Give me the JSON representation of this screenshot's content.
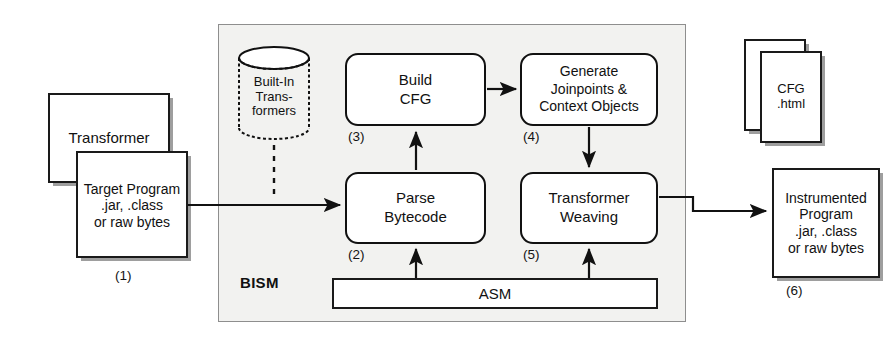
{
  "figure": {
    "container_label": "BISM"
  },
  "nodes": {
    "transformer": {
      "label": "Transformer"
    },
    "target_program": {
      "line1": "Target Program",
      "line2": ".jar, .class",
      "line3": "or raw bytes",
      "step": "(1)"
    },
    "builtin_transformers": {
      "line1": "Built-In",
      "line2": "Trans-",
      "line3": "formers"
    },
    "build_cfg": {
      "line1": "Build",
      "line2": "CFG",
      "step": "(3)"
    },
    "generate_joinpoints": {
      "line1": "Generate",
      "line2": "Joinpoints &",
      "line3": "Context Objects",
      "step": "(4)"
    },
    "parse_bytecode": {
      "line1": "Parse",
      "line2": "Bytecode",
      "step": "(2)"
    },
    "transformer_weaving": {
      "line1": "Transformer",
      "line2": "Weaving",
      "step": "(5)"
    },
    "asm": {
      "label": "ASM"
    },
    "cfg_doc_back": {
      "line1": "CFG",
      "line2": ".html"
    },
    "cfg_doc_front": {
      "line1": "CFG",
      "line2": ".html"
    },
    "instrumented_program": {
      "line1": "Instrumented",
      "line2": "Program",
      "line3": ".jar, .class",
      "line4": "or raw bytes",
      "step": "(6)"
    }
  },
  "colors": {
    "stroke": "#111111",
    "panel_fill": "#f2f2f0",
    "panel_stroke": "#8e8e8e",
    "background": "#ffffff"
  }
}
